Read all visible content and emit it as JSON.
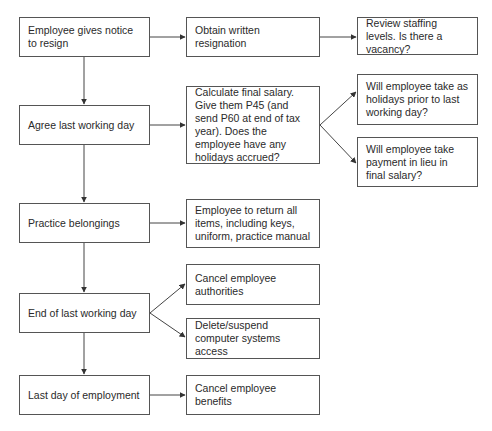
{
  "diagram": {
    "type": "flowchart",
    "colors": {
      "border": "#555555",
      "text": "#2a2a2a",
      "arrow": "#333333",
      "background": "#ffffff"
    },
    "nodes": {
      "n1": {
        "label": "Employee gives notice to resign"
      },
      "n2": {
        "label": "Agree last working day"
      },
      "n3": {
        "label": "Practice belongings"
      },
      "n4": {
        "label": "End of last working day"
      },
      "n5": {
        "label": "Last day of employment"
      },
      "m1": {
        "label": "Obtain written resignation"
      },
      "m2": {
        "label": "Calculate final salary. Give them P45 (and send P60 at end of tax year). Does the employee have any holidays accrued?"
      },
      "m3": {
        "label": "Employee to return all items, including keys, uniform, practice manual"
      },
      "m4": {
        "label": "Cancel employee authorities"
      },
      "m5": {
        "label": "Delete/suspend computer systems access"
      },
      "m6": {
        "label": "Cancel employee benefits"
      },
      "r1": {
        "label": "Review staffing levels. Is there a vacancy?"
      },
      "r2": {
        "label": "Will employee take as holidays prior to last working day?"
      },
      "r3": {
        "label": "Will employee take payment in lieu in final salary?"
      }
    },
    "edges": [
      {
        "from": "n1",
        "to": "n2"
      },
      {
        "from": "n2",
        "to": "n3"
      },
      {
        "from": "n3",
        "to": "n4"
      },
      {
        "from": "n4",
        "to": "n5"
      },
      {
        "from": "n1",
        "to": "m1"
      },
      {
        "from": "m1",
        "to": "r1"
      },
      {
        "from": "n2",
        "to": "m2"
      },
      {
        "from": "m2",
        "to": "r2"
      },
      {
        "from": "m2",
        "to": "r3"
      },
      {
        "from": "n3",
        "to": "m3"
      },
      {
        "from": "n4",
        "to": "m4"
      },
      {
        "from": "n4",
        "to": "m5"
      },
      {
        "from": "n5",
        "to": "m6"
      }
    ]
  }
}
